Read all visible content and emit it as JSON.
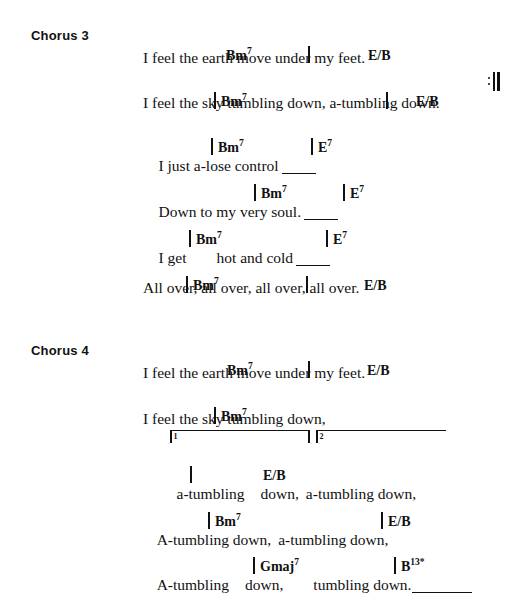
{
  "page": {
    "background_color": "#ffffff",
    "text_color": "#111111",
    "width": 530,
    "height": 591
  },
  "sections": [
    {
      "label": "Chorus 3",
      "lines": [
        {
          "chords": [
            {
              "root": "Bm",
              "ext": "7",
              "barline_before": false
            },
            {
              "root": "",
              "ext": "",
              "barline_before": true
            },
            {
              "root": "E/B",
              "ext": "",
              "barline_before": false
            }
          ],
          "lyric": "I feel the earth move under my feet."
        },
        {
          "chords": [
            {
              "root": "Bm",
              "ext": "7",
              "barline_before": true
            },
            {
              "root": "",
              "ext": "",
              "barline_before": true
            },
            {
              "root": "E/B",
              "ext": "",
              "barline_before": false
            }
          ],
          "lyric": "I feel the sky tumbling down, a-tumbling down.",
          "repeat_sign": true
        },
        {
          "chords": [
            {
              "root": "Bm",
              "ext": "7",
              "barline_before": true
            },
            {
              "root": "E",
              "ext": "7",
              "barline_before": true
            }
          ],
          "lyric": "I just a-lose control",
          "hold": true
        },
        {
          "chords": [
            {
              "root": "Bm",
              "ext": "7",
              "barline_before": true
            },
            {
              "root": "E",
              "ext": "7",
              "barline_before": true
            }
          ],
          "lyric": "Down to my very soul.",
          "hold": true
        },
        {
          "chords": [
            {
              "root": "Bm",
              "ext": "7",
              "barline_before": true
            },
            {
              "root": "E",
              "ext": "7",
              "barline_before": true
            }
          ],
          "lyric_parts": [
            "I get",
            "hot and cold"
          ],
          "hold": true
        },
        {
          "chords": [
            {
              "root": "Bm",
              "ext": "7",
              "barline_before": true
            },
            {
              "root": "",
              "ext": "",
              "barline_before": true
            },
            {
              "root": "E/B",
              "ext": "",
              "barline_before": false
            }
          ],
          "lyric": "All over, all over, all over, all over."
        }
      ]
    },
    {
      "label": "Chorus 4",
      "lines": [
        {
          "chords": [
            {
              "root": "Bm",
              "ext": "7",
              "barline_before": false
            },
            {
              "root": "",
              "ext": "",
              "barline_before": true
            },
            {
              "root": "E/B",
              "ext": "",
              "barline_before": false
            }
          ],
          "lyric": "I feel the earth move under my feet."
        },
        {
          "chords": [
            {
              "root": "Bm",
              "ext": "7",
              "barline_before": true
            }
          ],
          "lyric": "I feel the sky tumbling down,"
        },
        {
          "voltas": [
            {
              "number": "1",
              "closed": true
            },
            {
              "number": "2",
              "closed": false
            }
          ]
        },
        {
          "chords": [
            {
              "root": "",
              "ext": "",
              "barline_before": true
            },
            {
              "root": "E/B",
              "ext": "",
              "barline_before": false
            }
          ],
          "lyric_parts": [
            "a-tumbling",
            "down,",
            "a-tumbling down,"
          ]
        },
        {
          "chords": [
            {
              "root": "Bm",
              "ext": "7",
              "barline_before": true
            },
            {
              "root": "E/B",
              "ext": "",
              "barline_before": true
            }
          ],
          "lyric_parts": [
            "A-tumbling down,",
            "a-tumbling down,"
          ]
        },
        {
          "chords": [
            {
              "root": "Gmaj",
              "ext": "7",
              "barline_before": true
            },
            {
              "root": "B",
              "ext": "13",
              "star": "*",
              "barline_before": true
            }
          ],
          "lyric_parts": [
            "A-tumbling",
            "down,",
            "tumbling down."
          ],
          "hold": true
        }
      ]
    }
  ],
  "text": {
    "chorus3_label": "Chorus 3",
    "chorus4_label": "Chorus 4",
    "c3_l1_chord1": "Bm",
    "c3_l1_chord1_sup": "7",
    "c3_l1_chord2": "E/B",
    "c3_l1_lyric": "I feel the earth move under my feet.",
    "c3_l2_chord1": "Bm",
    "c3_l2_chord1_sup": "7",
    "c3_l2_chord2": "E/B",
    "c3_l2_lyric": "I feel the sky tumbling down, a-tumbling down.",
    "c3_l3_chord1": "Bm",
    "c3_l3_chord1_sup": "7",
    "c3_l3_chord2": "E",
    "c3_l3_chord2_sup": "7",
    "c3_l3_lyric": "I just a-lose control",
    "c3_l4_chord1": "Bm",
    "c3_l4_chord1_sup": "7",
    "c3_l4_chord2": "E",
    "c3_l4_chord2_sup": "7",
    "c3_l4_lyric": "Down to my very soul.",
    "c3_l5_chord1": "Bm",
    "c3_l5_chord1_sup": "7",
    "c3_l5_chord2": "E",
    "c3_l5_chord2_sup": "7",
    "c3_l5_lyric_a": "I get",
    "c3_l5_lyric_b": "hot and cold",
    "c3_l6_chord1": "Bm",
    "c3_l6_chord1_sup": "7",
    "c3_l6_chord2": "E/B",
    "c3_l6_lyric": "All over, all over, all over, all over.",
    "c4_l1_chord1": "Bm",
    "c4_l1_chord1_sup": "7",
    "c4_l1_chord2": "E/B",
    "c4_l1_lyric": "I feel the earth move under my feet.",
    "c4_l2_chord1": "Bm",
    "c4_l2_chord1_sup": "7",
    "c4_l2_lyric": "I feel the sky tumbling down,",
    "c4_volta1_num": "1",
    "c4_volta2_num": "2",
    "c4_l3_chord2": "E/B",
    "c4_l3_lyric_a": "a-tumbling",
    "c4_l3_lyric_b": "down,",
    "c4_l3_lyric_c": "a-tumbling down,",
    "c4_l4_chord1": "Bm",
    "c4_l4_chord1_sup": "7",
    "c4_l4_chord2": "E/B",
    "c4_l4_lyric_a": "A-tumbling down,",
    "c4_l4_lyric_b": "a-tumbling down,",
    "c4_l5_chord1": "Gmaj",
    "c4_l5_chord1_sup": "7",
    "c4_l5_chord2": "B",
    "c4_l5_chord2_sup": "13",
    "c4_l5_chord2_star": "*",
    "c4_l5_lyric_a": "A-tumbling",
    "c4_l5_lyric_b": "down,",
    "c4_l5_lyric_c": "tumbling down."
  }
}
